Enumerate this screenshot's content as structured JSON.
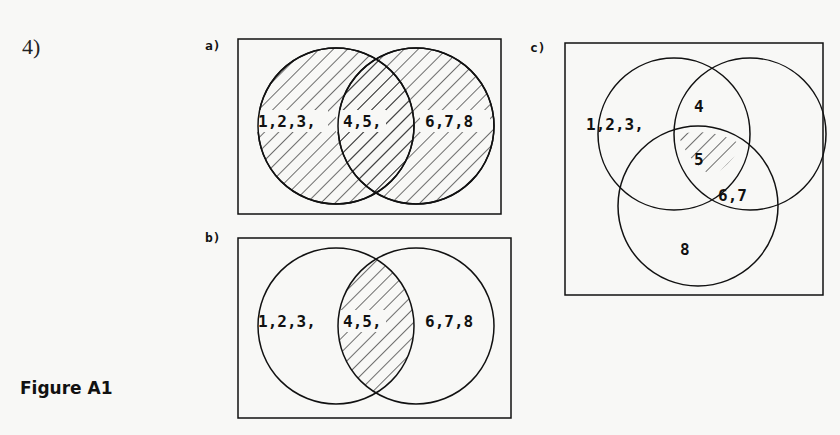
{
  "question_number": "4)",
  "figure_caption": "Figure A1",
  "panels": [
    {
      "label": "a)",
      "type": "two-set-venn",
      "shaded": "union (A ∪ B)",
      "regions": {
        "left_only": "1,2,3,",
        "intersection": "4,5,",
        "right_only": "6,7,8"
      }
    },
    {
      "label": "b)",
      "type": "two-set-venn",
      "shaded": "intersection (A ∩ B)",
      "regions": {
        "left_only": "1,2,3,",
        "intersection": "4,5,",
        "right_only": "6,7,8"
      }
    },
    {
      "label": "c)",
      "type": "three-set-venn",
      "shaded": "triple intersection (A ∩ B ∩ C)",
      "regions": {
        "left_only": "1,2,3,",
        "top_pair": "4",
        "center": "5",
        "right_bottom_pair": "6,7",
        "bottom_only": "8"
      }
    }
  ]
}
